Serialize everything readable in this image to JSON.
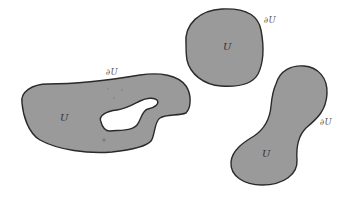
{
  "figure": {
    "colors": {
      "fill": "#9a9a9a",
      "stroke": "#2a2a2a",
      "background": "#ffffff"
    },
    "regions": [
      {
        "id": "left",
        "interior_label": "U",
        "boundary_label": "∂U",
        "has_hole": true
      },
      {
        "id": "top-right",
        "interior_label": "U",
        "boundary_label": "∂U",
        "has_hole": false
      },
      {
        "id": "bottom-right",
        "interior_label": "U",
        "boundary_label": "∂U",
        "has_hole": false
      }
    ]
  }
}
